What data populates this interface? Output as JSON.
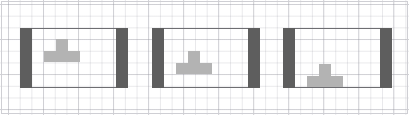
{
  "figure": {
    "width": 409,
    "height": 115,
    "background_color": "#ffffff",
    "grid": {
      "visible": true,
      "minor_cell_px": 11.7,
      "major_cell_px": 35,
      "minor_color": "#78788722",
      "major_color": "#9696a04d"
    },
    "border": {
      "visible": true,
      "color": "#cfcfd4",
      "width_px": 1
    }
  },
  "colors": {
    "wall": "#5e5e5e",
    "piece": "#b3b3b3",
    "floor_line": "#6e6e72",
    "ceiling_line": "#6e6e72",
    "background": "#ffffff"
  },
  "panels": [
    {
      "name": "frame-1",
      "label": "1",
      "left": 20,
      "width": 108,
      "ceiling_y": 28,
      "floor_y": 87,
      "left_wall": {
        "x": 20,
        "y": 28,
        "w": 12,
        "h": 60
      },
      "right_wall": {
        "x": 116,
        "y": 28,
        "w": 12,
        "h": 60
      },
      "piece": {
        "name": "t-tetromino",
        "orientation": "stem-up",
        "stem": {
          "x": 56,
          "y": 39,
          "w": 12,
          "h": 12
        },
        "base": {
          "x": 44,
          "y": 51,
          "w": 36,
          "h": 11
        },
        "resting": false
      }
    },
    {
      "name": "frame-2",
      "label": "2",
      "left": 152,
      "width": 108,
      "ceiling_y": 28,
      "floor_y": 87,
      "left_wall": {
        "x": 152,
        "y": 28,
        "w": 12,
        "h": 60
      },
      "right_wall": {
        "x": 248,
        "y": 28,
        "w": 12,
        "h": 60
      },
      "piece": {
        "name": "t-tetromino",
        "orientation": "stem-up",
        "stem": {
          "x": 188,
          "y": 51,
          "w": 12,
          "h": 12
        },
        "base": {
          "x": 176,
          "y": 63,
          "w": 36,
          "h": 11
        },
        "resting": false
      }
    },
    {
      "name": "frame-3",
      "label": "3",
      "left": 283,
      "width": 109,
      "ceiling_y": 28,
      "floor_y": 87,
      "left_wall": {
        "x": 283,
        "y": 28,
        "w": 12,
        "h": 60
      },
      "right_wall": {
        "x": 380,
        "y": 28,
        "w": 12,
        "h": 60
      },
      "piece": {
        "name": "t-tetromino",
        "orientation": "stem-up",
        "stem": {
          "x": 319,
          "y": 64,
          "w": 12,
          "h": 12
        },
        "base": {
          "x": 307,
          "y": 76,
          "w": 36,
          "h": 11
        },
        "resting": true
      }
    }
  ]
}
